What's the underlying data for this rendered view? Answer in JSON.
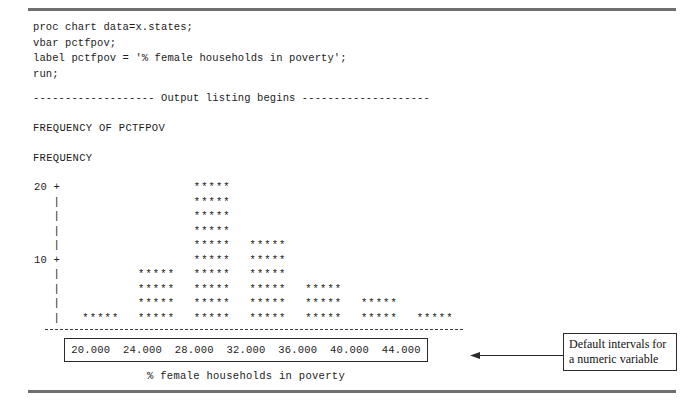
{
  "code": {
    "lines": [
      "proc chart data=x.states;",
      "vbar pctfpov;",
      "label pctfpov = '% female households in poverty';",
      "run;"
    ]
  },
  "divider": "------------------- Output listing begins --------------------",
  "output": {
    "frequency_of_title": "FREQUENCY OF PCTFPOV",
    "frequency_axis_title": "FREQUENCY"
  },
  "callout": {
    "line1": "Default intervals for",
    "line2": "a numeric variable",
    "arrow_icon": "arrow-left-icon"
  },
  "chart_data": {
    "type": "bar",
    "title": "FREQUENCY OF PCTFPOV",
    "xlabel": "% female households in poverty",
    "ylabel": "FREQUENCY",
    "categories": [
      "20.000",
      "24.000",
      "28.000",
      "32.000",
      "36.000",
      "40.000",
      "44.000"
    ],
    "values": [
      2,
      8,
      20,
      12,
      6,
      4,
      2
    ],
    "star_rows": [
      1,
      4,
      10,
      6,
      3,
      2,
      1
    ],
    "units_per_row": 2,
    "bar_glyph": "*****",
    "ylim": [
      0,
      20
    ],
    "y_tick_labels": [
      "20 +",
      "|",
      "|",
      "|",
      "|",
      "10 +",
      "|",
      "|",
      "|",
      "|"
    ],
    "grid": false,
    "legend": "none"
  }
}
